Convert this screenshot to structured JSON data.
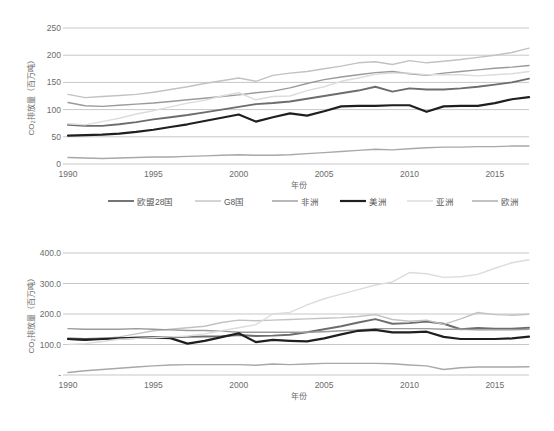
{
  "charts": [
    {
      "id": "chart-top",
      "ylabel": "CO₂排放量（百万吨）",
      "xlabel": "年份",
      "ytick_labels": [
        "0",
        "50",
        "100",
        "150",
        "200",
        "250"
      ],
      "xtick_labels": [
        "1990",
        "1995",
        "2000",
        "2005",
        "2010",
        "2015"
      ],
      "legend": [
        {
          "label": "欧盟28国",
          "color": "#6d6d6f",
          "width": 1.9
        },
        {
          "label": "G8国",
          "color": "#c2c2c4",
          "width": 1.4
        },
        {
          "label": "非洲",
          "color": "#9a9a9c",
          "width": 1.4
        },
        {
          "label": "美洲",
          "color": "#1f1f21",
          "width": 2.2
        },
        {
          "label": "亚洲",
          "color": "#dcdcde",
          "width": 1.4
        },
        {
          "label": "欧洲",
          "color": "#a8a8aa",
          "width": 1.4
        }
      ],
      "chart_data": {
        "type": "line",
        "title": "",
        "xlabel": "年份",
        "ylabel": "CO₂排放量（百万吨）",
        "xlim": [
          1990,
          2017
        ],
        "ylim": [
          0,
          250
        ],
        "yticks": [
          0,
          50,
          100,
          150,
          200,
          250
        ],
        "xticks": [
          1990,
          1995,
          2000,
          2005,
          2010,
          2015
        ],
        "grid": true,
        "legend_position": "bottom",
        "x": [
          1990,
          1991,
          1992,
          1993,
          1994,
          1995,
          1996,
          1997,
          1998,
          1999,
          2000,
          2001,
          2002,
          2003,
          2004,
          2005,
          2006,
          2007,
          2008,
          2009,
          2010,
          2011,
          2012,
          2013,
          2014,
          2015,
          2016,
          2017
        ],
        "series": [
          {
            "name": "欧盟28国",
            "color": "#6d6d6f",
            "values": [
              72,
              70,
              70,
              73,
              77,
              82,
              86,
              90,
              95,
              100,
              105,
              110,
              112,
              115,
              120,
              125,
              130,
              135,
              142,
              133,
              139,
              137,
              137,
              139,
              142,
              146,
              150,
              157
            ]
          },
          {
            "name": "G8国",
            "color": "#c2c2c4",
            "values": [
              128,
              122,
              124,
              126,
              128,
              132,
              137,
              142,
              148,
              153,
              158,
              152,
              163,
              167,
              170,
              175,
              180,
              186,
              188,
              183,
              190,
              186,
              189,
              192,
              196,
              200,
              205,
              213
            ]
          },
          {
            "name": "非洲",
            "color": "#9a9a9c",
            "values": [
              113,
              107,
              106,
              108,
              110,
              112,
              115,
              118,
              121,
              124,
              127,
              131,
              134,
              140,
              148,
              155,
              160,
              164,
              168,
              170,
              166,
              163,
              167,
              170,
              173,
              176,
              178,
              181
            ]
          },
          {
            "name": "美洲",
            "color": "#1f1f21",
            "values": [
              52,
              53,
              54,
              56,
              59,
              63,
              68,
              73,
              79,
              85,
              91,
              78,
              86,
              93,
              89,
              97,
              106,
              107,
              107,
              108,
              108,
              96,
              106,
              107,
              107,
              112,
              119,
              123
            ]
          },
          {
            "name": "亚洲",
            "color": "#dcdcde",
            "values": [
              74,
              72,
              78,
              84,
              92,
              98,
              105,
              112,
              117,
              125,
              131,
              118,
              124,
              125,
              135,
              142,
              152,
              158,
              165,
              167,
              167,
              164,
              164,
              164,
              162,
              164,
              166,
              170
            ]
          },
          {
            "name": "欧洲",
            "color": "#a8a8aa",
            "values": [
              12,
              11,
              10,
              11,
              12,
              13,
              13,
              14,
              15,
              16,
              17,
              16,
              16,
              17,
              19,
              21,
              23,
              25,
              27,
              26,
              28,
              30,
              31,
              31,
              32,
              32,
              33,
              33
            ]
          }
        ]
      }
    },
    {
      "id": "chart-bottom",
      "ylabel": "CO₂排放量（百万吨）",
      "xlabel": "年份",
      "ytick_labels": [
        "-",
        "100.0",
        "200.0",
        "300.0",
        "400.0"
      ],
      "xtick_labels": [
        "1990",
        "1995",
        "2000",
        "2005",
        "2010",
        "2015"
      ],
      "legend": [
        {
          "label": "欧盟28国",
          "color": "#6d6d6f",
          "width": 1.9
        },
        {
          "label": "G8国",
          "color": "#c2c2c4",
          "width": 1.4
        },
        {
          "label": "非洲",
          "color": "#9a9a9c",
          "width": 1.4
        },
        {
          "label": "美洲",
          "color": "#1f1f21",
          "width": 2.2
        },
        {
          "label": "亚洲",
          "color": "#dcdcde",
          "width": 1.4
        },
        {
          "label": "欧洲",
          "color": "#a8a8aa",
          "width": 1.4
        }
      ],
      "chart_data": {
        "type": "line",
        "title": "",
        "xlabel": "年份",
        "ylabel": "CO₂排放量（百万吨）",
        "xlim": [
          1990,
          2017
        ],
        "ylim": [
          0,
          400
        ],
        "yticks": [
          0,
          100,
          200,
          300,
          400
        ],
        "xticks": [
          1990,
          1995,
          2000,
          2005,
          2010,
          2015
        ],
        "grid": true,
        "legend_position": "bottom",
        "x": [
          1990,
          1991,
          1992,
          1993,
          1994,
          1995,
          1996,
          1997,
          1998,
          1999,
          2000,
          2001,
          2002,
          2003,
          2004,
          2005,
          2006,
          2007,
          2008,
          2009,
          2010,
          2011,
          2012,
          2013,
          2014,
          2015,
          2016,
          2017
        ],
        "series": [
          {
            "name": "欧盟28国",
            "color": "#6d6d6f",
            "values": [
              120,
              118,
              120,
              121,
              122,
              123,
              124,
              125,
              126,
              127,
              131,
              128,
              129,
              132,
              140,
              150,
              160,
              172,
              183,
              168,
              170,
              175,
              168,
              150,
              154,
              152,
              152,
              155
            ]
          },
          {
            "name": "G8国",
            "color": "#c2c2c4",
            "values": [
              117,
              114,
              120,
              125,
              135,
              145,
              150,
              155,
              160,
              172,
              180,
              178,
              180,
              182,
              184,
              186,
              188,
              192,
              198,
              182,
              176,
              180,
              166,
              184,
              205,
              198,
              196,
              199
            ]
          },
          {
            "name": "非洲",
            "color": "#9a9a9c",
            "values": [
              152,
              150,
              150,
              150,
              152,
              150,
              148,
              146,
              146,
              144,
              140,
              140,
              140,
              140,
              140,
              142,
              145,
              148,
              152,
              152,
              152,
              152,
              150,
              150,
              148,
              148,
              148,
              150
            ]
          },
          {
            "name": "美洲",
            "color": "#1f1f21",
            "values": [
              118,
              115,
              118,
              120,
              122,
              123,
              121,
              103,
              112,
              124,
              137,
              108,
              115,
              112,
              110,
              120,
              133,
              145,
              148,
              140,
              140,
              142,
              125,
              118,
              118,
              118,
              120,
              126
            ]
          },
          {
            "name": "亚洲",
            "color": "#dcdcde",
            "values": [
              100,
              103,
              110,
              117,
              120,
              122,
              125,
              128,
              135,
              145,
              155,
              165,
              200,
              205,
              230,
              250,
              265,
              280,
              295,
              305,
              336,
              332,
              320,
              322,
              330,
              350,
              368,
              378
            ]
          },
          {
            "name": "欧洲",
            "color": "#a8a8aa",
            "values": [
              8,
              14,
              18,
              22,
              26,
              30,
              33,
              34,
              34,
              34,
              34,
              32,
              36,
              34,
              36,
              38,
              38,
              38,
              38,
              37,
              33,
              30,
              18,
              24,
              26,
              26,
              26,
              27
            ]
          }
        ]
      }
    }
  ]
}
